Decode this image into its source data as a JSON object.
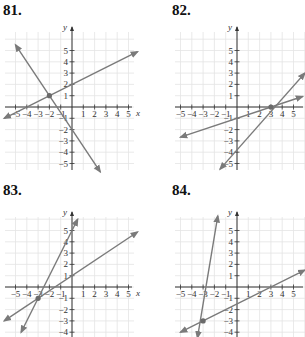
{
  "chart_data": [
    {
      "id": "81",
      "type": "line",
      "title": "81.",
      "xlabel": "x",
      "ylabel": "y",
      "xlim": [
        -6,
        6
      ],
      "ylim": [
        -5.5,
        6.5
      ],
      "grid": true,
      "x_ticks": [
        -5,
        -4,
        -3,
        -2,
        -1,
        1,
        2,
        3,
        4,
        5
      ],
      "y_ticks": [
        -5,
        -4,
        -3,
        -2,
        -1,
        1,
        2,
        3,
        4,
        5
      ],
      "series": [
        {
          "name": "line A",
          "slope": 0.5,
          "intercept": 2,
          "x": [
            -6,
            5.8
          ],
          "y": [
            -1,
            4.9
          ]
        },
        {
          "name": "line B",
          "slope": -1.5,
          "intercept": -2,
          "x": [
            -5,
            2.5
          ],
          "y": [
            5.5,
            -5.75
          ]
        }
      ],
      "intersection": {
        "x": -2,
        "y": 1
      },
      "color": "#7a7a7a"
    },
    {
      "id": "82",
      "type": "line",
      "title": "82.",
      "xlabel": "",
      "ylabel": "y",
      "xlim": [
        -5.5,
        6
      ],
      "ylim": [
        -5.5,
        6.5
      ],
      "grid": true,
      "x_ticks": [
        -5,
        -4,
        -3,
        -2,
        -1,
        1,
        2,
        3,
        4,
        5
      ],
      "y_ticks": [
        -5,
        -4,
        -3,
        -2,
        -1,
        1,
        2,
        3,
        4,
        5
      ],
      "series": [
        {
          "name": "line A",
          "slope": 0.3333,
          "intercept": -1,
          "x": [
            -5,
            5.8
          ],
          "y": [
            -2.67,
            0.93
          ]
        },
        {
          "name": "line B",
          "slope": 1,
          "intercept": -3,
          "x": [
            -1.5,
            6
          ],
          "y": [
            -5.5,
            3
          ]
        }
      ],
      "intersection": {
        "x": 3,
        "y": 0
      },
      "color": "#7a7a7a"
    },
    {
      "id": "83",
      "type": "line",
      "title": "83.",
      "xlabel": "x",
      "ylabel": "y",
      "xlim": [
        -6,
        6
      ],
      "ylim": [
        -4.5,
        6.5
      ],
      "grid": true,
      "x_ticks": [
        -5,
        -4,
        -3,
        -2,
        -1,
        1,
        2,
        3,
        4,
        5
      ],
      "y_ticks": [
        -4,
        -3,
        -2,
        -1,
        1,
        2,
        3,
        4,
        5
      ],
      "series": [
        {
          "name": "line A",
          "slope": 0.6667,
          "intercept": 1,
          "x": [
            -6,
            5.8
          ],
          "y": [
            -3,
            4.87
          ]
        },
        {
          "name": "line B",
          "slope": 2,
          "intercept": 5,
          "x": [
            -4.5,
            0.5
          ],
          "y": [
            -4,
            6
          ]
        }
      ],
      "intersection": {
        "x": -3,
        "y": -1
      },
      "color": "#7a7a7a"
    },
    {
      "id": "84",
      "type": "line",
      "title": "84.",
      "xlabel": "",
      "ylabel": "y",
      "xlim": [
        -5.5,
        6
      ],
      "ylim": [
        -4.5,
        6.5
      ],
      "grid": true,
      "x_ticks": [
        -5,
        -4,
        -3,
        -2,
        -1,
        1,
        2,
        3,
        4,
        5
      ],
      "y_ticks": [
        -4,
        -3,
        -2,
        -1,
        1,
        2,
        3,
        4,
        5
      ],
      "series": [
        {
          "name": "line A",
          "slope": 0.5,
          "intercept": -1.5,
          "x": [
            -5,
            6
          ],
          "y": [
            -4,
            1.5
          ]
        },
        {
          "name": "line B",
          "slope": 3,
          "intercept": 6,
          "x": [
            -3.5,
            -1.7
          ],
          "y": [
            -4.5,
            6.3
          ]
        }
      ],
      "intersection": {
        "x": -3,
        "y": -3
      },
      "color": "#7a7a7a"
    }
  ],
  "panels": [
    {
      "label": "81.",
      "origin": [
        72,
        107
      ],
      "grid_box": [
        5,
        32,
        134,
        170
      ],
      "show_x_label": true
    },
    {
      "label": "82.",
      "origin": [
        237,
        107
      ],
      "grid_box": [
        175,
        32,
        305,
        170
      ],
      "show_x_label": false
    },
    {
      "label": "83.",
      "origin": [
        72,
        287
      ],
      "grid_box": [
        5,
        217,
        134,
        337
      ],
      "show_x_label": true
    },
    {
      "label": "84.",
      "origin": [
        237,
        287
      ],
      "grid_box": [
        175,
        217,
        305,
        337
      ],
      "show_x_label": false
    }
  ],
  "style": {
    "unit_px": 11.3,
    "line_color": "#7a7a7a",
    "grid_color": "#e4e4e4",
    "axis_color": "#333333",
    "point_color": "#6a6a6a"
  }
}
